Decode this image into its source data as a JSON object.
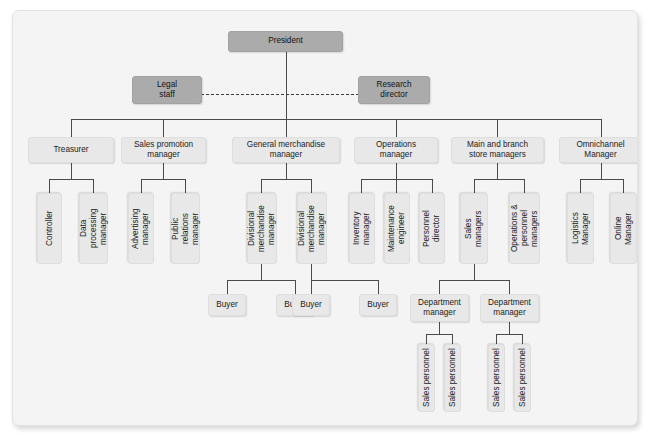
{
  "diagram": {
    "type": "org-chart",
    "colors": {
      "panel_background": "#f4f4f4",
      "node_fill": "#e8e8e8",
      "node_fill_executive": "#ababab",
      "connector": "#4a4a4a",
      "text": "#1b1b1b"
    },
    "nodes": {
      "president": "President",
      "legal_staff": "Legal\nstaff",
      "research_director": "Research\ndirector",
      "treasurer": "Treasurer",
      "sales_promotion_manager": "Sales promotion\nmanager",
      "general_merchandise_manager": "General merchandise\nmanager",
      "operations_manager": "Operations\nmanager",
      "main_and_branch_store_managers": "Main and branch\nstore managers",
      "omnichannel_manager": "Omnichannel\nManager",
      "controller": "Controller",
      "data_processing_manager": "Data\nprocessing\nmanager",
      "advertising_manager": "Advertising\nmanager",
      "public_relations_manager": "Public\nrelations\nmanager",
      "divisional_merchandise_manager_1": "Divisional\nmerchandise\nmanager",
      "divisional_merchandise_manager_2": "Divisional\nmerchandise\nmanager",
      "inventory_manager": "Inventory\nmanager",
      "maintenance_engineer": "Maintenance\nengineer",
      "personnel_director": "Personnel\ndirector",
      "sales_managers": "Sales\nmanagers",
      "operations_personnel_managers": "Operations &\npersonnel\nmanagers",
      "logistics_manager": "Logistics\nManager",
      "online_manager": "Online\nManager",
      "buyer_1": "Buyer",
      "buyer_2": "Buyer",
      "buyer_3": "Buyer",
      "buyer_4": "Buyer",
      "department_manager_1": "Department\nmanager",
      "department_manager_2": "Department\nmanager",
      "sales_personnel_1": "Sales personnel",
      "sales_personnel_2": "Sales personnel",
      "sales_personnel_3": "Sales personnel",
      "sales_personnel_4": "Sales personnel"
    }
  }
}
